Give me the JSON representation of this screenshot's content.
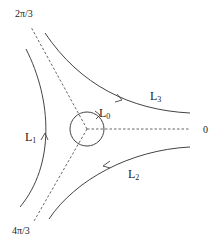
{
  "diagram": {
    "rays": [
      {
        "label": "0",
        "angle": "0"
      },
      {
        "label": "2π/3",
        "angle": "2π/3"
      },
      {
        "label": "4π/3",
        "angle": "4π/3"
      }
    ],
    "contours": [
      {
        "name": "L",
        "sub": "0",
        "type": "circle",
        "orientation": "counterclockwise"
      },
      {
        "name": "L",
        "sub": "1",
        "type": "curve",
        "direction": "upward"
      },
      {
        "name": "L",
        "sub": "2",
        "type": "curve",
        "direction": "toward lower-left"
      },
      {
        "name": "L",
        "sub": "3",
        "type": "curve",
        "direction": "toward right"
      }
    ],
    "colors": {
      "line": "#444444",
      "dashed": "#555555",
      "text": "#222222"
    }
  }
}
